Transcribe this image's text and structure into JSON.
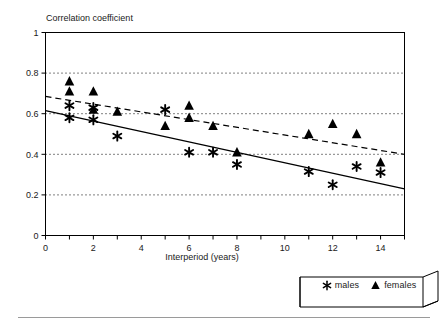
{
  "chart_data": {
    "type": "scatter",
    "title": "",
    "ylabel": "Correlation coefficient",
    "xlabel": "Interperiod (years)",
    "xlim": [
      0,
      15
    ],
    "ylim": [
      0,
      1
    ],
    "xticks": [
      0,
      1,
      2,
      3,
      4,
      5,
      6,
      7,
      8,
      9,
      10,
      11,
      12,
      13,
      14,
      15
    ],
    "xtick_labels": [
      "0",
      "",
      "2",
      "",
      "4",
      "",
      "6",
      "",
      "8",
      "",
      "10",
      "",
      "12",
      "",
      "14",
      ""
    ],
    "yticks": [
      0,
      0.2,
      0.4,
      0.6,
      0.8,
      1
    ],
    "ytick_labels": [
      "0",
      "0.2",
      "0.4",
      "0.6",
      "0.8",
      "1"
    ],
    "grid": "horizontal-dotted",
    "gridlines_y": [
      0.2,
      0.4,
      0.6,
      0.8
    ],
    "legend_position": "below-right",
    "series": [
      {
        "name": "males",
        "marker": "asterisk",
        "points": [
          {
            "x": 1,
            "y": 0.64
          },
          {
            "x": 1,
            "y": 0.58
          },
          {
            "x": 2,
            "y": 0.63
          },
          {
            "x": 2,
            "y": 0.57
          },
          {
            "x": 3,
            "y": 0.49
          },
          {
            "x": 5,
            "y": 0.62
          },
          {
            "x": 6,
            "y": 0.41
          },
          {
            "x": 7,
            "y": 0.41
          },
          {
            "x": 8,
            "y": 0.35
          },
          {
            "x": 11,
            "y": 0.315
          },
          {
            "x": 12,
            "y": 0.25
          },
          {
            "x": 13,
            "y": 0.34
          },
          {
            "x": 14,
            "y": 0.31
          }
        ],
        "trend_line": {
          "style": "solid",
          "x0": 0,
          "y0": 0.615,
          "x1": 15,
          "y1": 0.23
        }
      },
      {
        "name": "females",
        "marker": "triangle",
        "points": [
          {
            "x": 1,
            "y": 0.76
          },
          {
            "x": 1,
            "y": 0.71
          },
          {
            "x": 2,
            "y": 0.71
          },
          {
            "x": 2,
            "y": 0.62
          },
          {
            "x": 3,
            "y": 0.61
          },
          {
            "x": 5,
            "y": 0.54
          },
          {
            "x": 6,
            "y": 0.64
          },
          {
            "x": 6,
            "y": 0.58
          },
          {
            "x": 7,
            "y": 0.54
          },
          {
            "x": 8,
            "y": 0.41
          },
          {
            "x": 11,
            "y": 0.5
          },
          {
            "x": 12,
            "y": 0.55
          },
          {
            "x": 13,
            "y": 0.5
          },
          {
            "x": 14,
            "y": 0.36
          }
        ],
        "trend_line": {
          "style": "dashed",
          "x0": 0,
          "y0": 0.685,
          "x1": 15,
          "y1": 0.4
        }
      }
    ]
  },
  "legend": {
    "males_marker": "asterisk-icon",
    "males_label": "males",
    "females_marker": "triangle-icon",
    "females_label": "females"
  }
}
